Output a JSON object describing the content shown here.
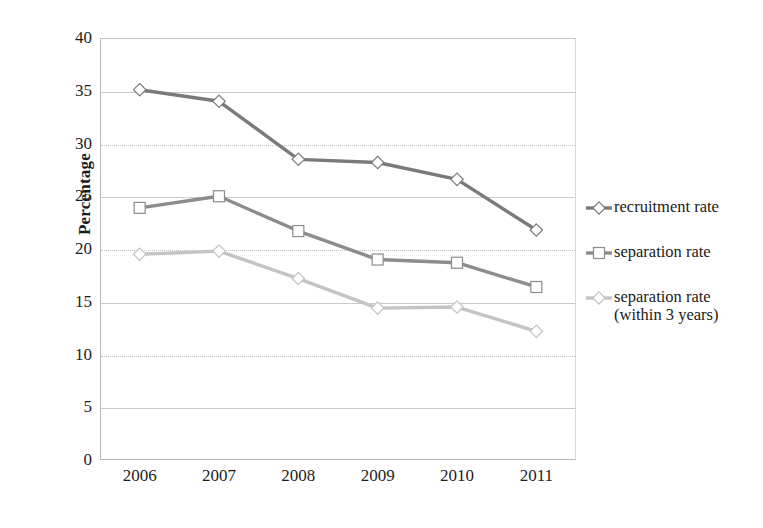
{
  "chart_data": {
    "type": "line",
    "title": "",
    "xlabel": "",
    "ylabel": "Percentage",
    "categories": [
      "2006",
      "2007",
      "2008",
      "2009",
      "2010",
      "2011"
    ],
    "ylim": [
      0,
      40
    ],
    "ytick_values": [
      0,
      5,
      10,
      15,
      20,
      25,
      30,
      35,
      40
    ],
    "ytick_labels": [
      "0",
      "5",
      "10",
      "15",
      "20",
      "25",
      "30",
      "35",
      "40"
    ],
    "grid": true,
    "grid_axis": "y",
    "legend_position": "right",
    "series": [
      {
        "name": "recruitment rate",
        "marker": "diamond",
        "color": "#7a7a7a",
        "values": [
          35.1,
          34.0,
          28.5,
          28.2,
          26.6,
          21.8
        ]
      },
      {
        "name": "separation rate",
        "marker": "square",
        "color": "#8c8c8c",
        "values": [
          23.9,
          25.0,
          21.7,
          19.0,
          18.7,
          16.4
        ]
      },
      {
        "name": "separation rate (within 3 years)",
        "marker": "diamond",
        "color": "#c4c4c4",
        "values": [
          19.5,
          19.8,
          17.2,
          14.4,
          14.5,
          12.2
        ]
      }
    ]
  },
  "legend": {
    "entries": [
      {
        "label": "recruitment rate",
        "marker": "diamond-marker-icon",
        "color": "#7a7a7a"
      },
      {
        "label": "separation rate",
        "marker": "square-marker-icon",
        "color": "#8c8c8c"
      },
      {
        "label": "separation rate\n(within 3 years)",
        "marker": "diamond-marker-icon",
        "color": "#c4c4c4"
      }
    ]
  },
  "axes": {
    "y_title": "Percentage"
  }
}
